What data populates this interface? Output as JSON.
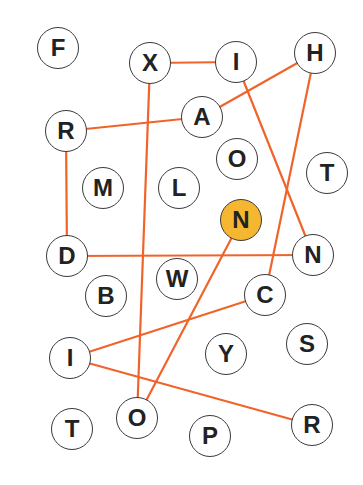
{
  "puzzle": {
    "colors": {
      "line": "#f0642a",
      "node_border": "#3a3a3a",
      "node_fill": "#ffffff",
      "highlight_fill": "#f5b731",
      "letter": "#222222"
    },
    "nodes": [
      {
        "id": "F1",
        "letter": "F",
        "x": 58,
        "y": 48,
        "highlight": false
      },
      {
        "id": "X1",
        "letter": "X",
        "x": 150,
        "y": 63,
        "highlight": false
      },
      {
        "id": "I1",
        "letter": "I",
        "x": 236,
        "y": 62,
        "highlight": false
      },
      {
        "id": "H1",
        "letter": "H",
        "x": 315,
        "y": 53,
        "highlight": false
      },
      {
        "id": "A1",
        "letter": "A",
        "x": 202,
        "y": 117,
        "highlight": false
      },
      {
        "id": "R1",
        "letter": "R",
        "x": 66,
        "y": 131,
        "highlight": false
      },
      {
        "id": "O1",
        "letter": "O",
        "x": 237,
        "y": 159,
        "highlight": false
      },
      {
        "id": "T1",
        "letter": "T",
        "x": 327,
        "y": 173,
        "highlight": false
      },
      {
        "id": "M1",
        "letter": "M",
        "x": 103,
        "y": 188,
        "highlight": false
      },
      {
        "id": "L1",
        "letter": "L",
        "x": 179,
        "y": 188,
        "highlight": false
      },
      {
        "id": "N1",
        "letter": "N",
        "x": 241,
        "y": 220,
        "highlight": true
      },
      {
        "id": "D1",
        "letter": "D",
        "x": 67,
        "y": 256,
        "highlight": false
      },
      {
        "id": "N2",
        "letter": "N",
        "x": 313,
        "y": 255,
        "highlight": false
      },
      {
        "id": "W1",
        "letter": "W",
        "x": 177,
        "y": 279,
        "highlight": false
      },
      {
        "id": "B1",
        "letter": "B",
        "x": 106,
        "y": 296,
        "highlight": false
      },
      {
        "id": "C1",
        "letter": "C",
        "x": 265,
        "y": 295,
        "highlight": false
      },
      {
        "id": "S1",
        "letter": "S",
        "x": 307,
        "y": 344,
        "highlight": false
      },
      {
        "id": "I2",
        "letter": "I",
        "x": 70,
        "y": 358,
        "highlight": false
      },
      {
        "id": "Y1",
        "letter": "Y",
        "x": 226,
        "y": 354,
        "highlight": false
      },
      {
        "id": "T2",
        "letter": "T",
        "x": 72,
        "y": 429,
        "highlight": false
      },
      {
        "id": "O2",
        "letter": "O",
        "x": 137,
        "y": 418,
        "highlight": false
      },
      {
        "id": "R2",
        "letter": "R",
        "x": 312,
        "y": 425,
        "highlight": false
      },
      {
        "id": "P1",
        "letter": "P",
        "x": 210,
        "y": 436,
        "highlight": false
      }
    ],
    "edges": [
      {
        "from": "X1",
        "to": "I1"
      },
      {
        "from": "R1",
        "to": "A1"
      },
      {
        "from": "A1",
        "to": "H1"
      },
      {
        "from": "X1",
        "to": "O2"
      },
      {
        "from": "I1",
        "to": "N2"
      },
      {
        "from": "H1",
        "to": "C1"
      },
      {
        "from": "R1",
        "to": "D1"
      },
      {
        "from": "D1",
        "to": "N2"
      },
      {
        "from": "N1",
        "to": "O2"
      },
      {
        "from": "I2",
        "to": "C1"
      },
      {
        "from": "I2",
        "to": "R2"
      }
    ]
  }
}
